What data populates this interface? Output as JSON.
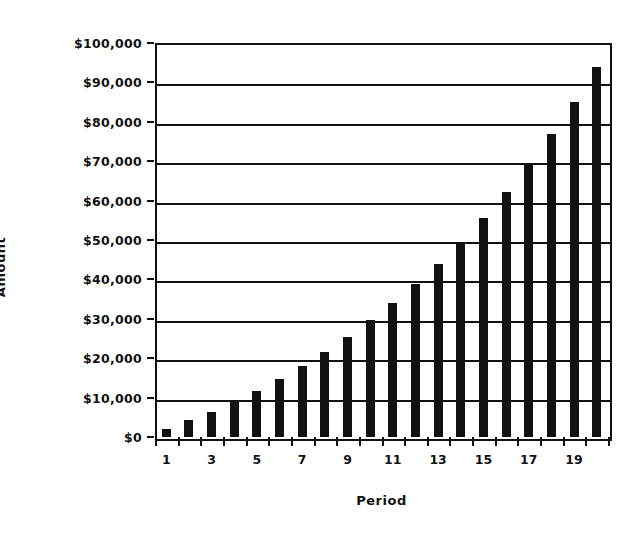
{
  "chart_data": {
    "type": "bar",
    "title": "",
    "xlabel": "Period",
    "ylabel": "Amount",
    "grid": true,
    "legend": "none",
    "categories": [
      1,
      2,
      3,
      4,
      5,
      6,
      7,
      8,
      9,
      10,
      11,
      12,
      13,
      14,
      15,
      16,
      17,
      18,
      19,
      20
    ],
    "values": [
      2000,
      4200,
      6400,
      9000,
      11800,
      14800,
      18000,
      21600,
      25400,
      29600,
      34000,
      38800,
      44000,
      49600,
      55600,
      62200,
      69200,
      76800,
      85000,
      93800
    ],
    "xlim": [
      0.5,
      20.5
    ],
    "ylim": [
      0,
      100000
    ],
    "x_tick_labels": [
      "1",
      "3",
      "5",
      "7",
      "9",
      "11",
      "13",
      "15",
      "17",
      "19"
    ],
    "x_tick_values": [
      1,
      3,
      5,
      7,
      9,
      11,
      13,
      15,
      17,
      19
    ],
    "y_tick_labels": [
      "$0",
      "$10,000",
      "$20,000",
      "$30,000",
      "$40,000",
      "$50,000",
      "$60,000",
      "$70,000",
      "$80,000",
      "$90,000",
      "$100,000"
    ],
    "y_tick_values": [
      0,
      10000,
      20000,
      30000,
      40000,
      50000,
      60000,
      70000,
      80000,
      90000,
      100000
    ],
    "bar_color": "#111111",
    "axis_color": "#111111",
    "background_color": "#ffffff"
  }
}
